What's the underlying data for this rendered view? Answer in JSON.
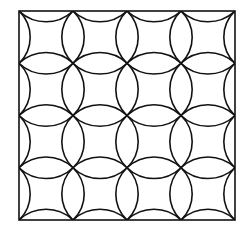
{
  "figure": {
    "type": "overlapping-circles-tiling",
    "grid": {
      "rows": 4,
      "cols": 4
    },
    "frame": {
      "x": 19,
      "y": 11,
      "width": 216,
      "height": 209
    },
    "stroke_color": "#111111",
    "background_color": "#ffffff",
    "stroke_width": 1.6
  }
}
